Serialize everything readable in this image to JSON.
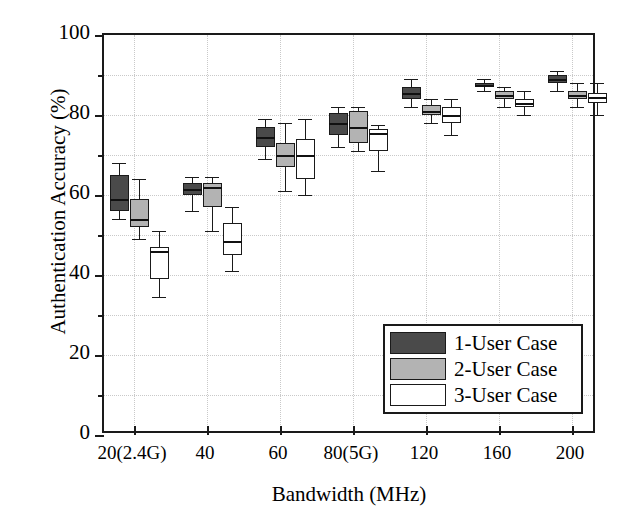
{
  "chart_data": {
    "type": "box",
    "title": "",
    "xlabel": "Bandwidth (MHz)",
    "ylabel": "Authentication Accuracy (%)",
    "ylim": [
      0,
      100
    ],
    "ytick_labels": [
      "0",
      "20",
      "40",
      "60",
      "80",
      "100"
    ],
    "ytick_values": [
      0,
      20,
      40,
      60,
      80,
      100
    ],
    "yminor_values": [
      10,
      30,
      50,
      70,
      90
    ],
    "grid": true,
    "legend_position": "lower right",
    "categories": [
      "20(2.4G)",
      "40",
      "60",
      "80(5G)",
      "120",
      "160",
      "200"
    ],
    "series": [
      {
        "name": "1-User Case",
        "color": "#4a4a4a",
        "boxes": [
          {
            "category": "20(2.4G)",
            "whisker_low": 54.0,
            "q1": 56.0,
            "median": 59.0,
            "q3": 65.0,
            "whisker_high": 68.0
          },
          {
            "category": "40",
            "whisker_low": 56.0,
            "q1": 60.0,
            "median": 61.5,
            "q3": 63.0,
            "whisker_high": 64.5
          },
          {
            "category": "60",
            "whisker_low": 69.0,
            "q1": 72.0,
            "median": 74.5,
            "q3": 77.0,
            "whisker_high": 79.0
          },
          {
            "category": "80(5G)",
            "whisker_low": 72.0,
            "q1": 75.0,
            "median": 78.0,
            "q3": 80.5,
            "whisker_high": 82.0
          },
          {
            "category": "120",
            "whisker_low": 82.0,
            "q1": 84.0,
            "median": 85.5,
            "q3": 87.0,
            "whisker_high": 89.0
          },
          {
            "category": "160",
            "whisker_low": 86.0,
            "q1": 87.0,
            "median": 87.5,
            "q3": 88.0,
            "whisker_high": 89.0
          },
          {
            "category": "200",
            "whisker_low": 86.0,
            "q1": 88.0,
            "median": 89.0,
            "q3": 90.0,
            "whisker_high": 91.0
          }
        ]
      },
      {
        "name": "2-User Case",
        "color": "#b3b3b3",
        "boxes": [
          {
            "category": "20(2.4G)",
            "whisker_low": 49.0,
            "q1": 52.0,
            "median": 54.0,
            "q3": 59.0,
            "whisker_high": 64.0
          },
          {
            "category": "40",
            "whisker_low": 51.0,
            "q1": 57.0,
            "median": 62.0,
            "q3": 63.0,
            "whisker_high": 64.5
          },
          {
            "category": "60",
            "whisker_low": 61.0,
            "q1": 67.0,
            "median": 70.0,
            "q3": 73.0,
            "whisker_high": 78.0
          },
          {
            "category": "80(5G)",
            "whisker_low": 71.0,
            "q1": 73.0,
            "median": 77.0,
            "q3": 81.0,
            "whisker_high": 82.0
          },
          {
            "category": "120",
            "whisker_low": 78.0,
            "q1": 80.0,
            "median": 81.0,
            "q3": 82.5,
            "whisker_high": 84.0
          },
          {
            "category": "160",
            "whisker_low": 82.0,
            "q1": 84.0,
            "median": 85.0,
            "q3": 86.0,
            "whisker_high": 87.0
          },
          {
            "category": "200",
            "whisker_low": 82.0,
            "q1": 84.0,
            "median": 85.0,
            "q3": 86.0,
            "whisker_high": 88.0
          }
        ]
      },
      {
        "name": "3-User Case",
        "color": "#ffffff",
        "boxes": [
          {
            "category": "20(2.4G)",
            "whisker_low": 34.5,
            "q1": 39.0,
            "median": 46.0,
            "q3": 47.0,
            "whisker_high": 51.0
          },
          {
            "category": "40",
            "whisker_low": 41.0,
            "q1": 45.0,
            "median": 48.5,
            "q3": 53.0,
            "whisker_high": 57.0
          },
          {
            "category": "60",
            "whisker_low": 60.0,
            "q1": 64.0,
            "median": 70.0,
            "q3": 74.0,
            "whisker_high": 79.0
          },
          {
            "category": "80(5G)",
            "whisker_low": 66.0,
            "q1": 71.0,
            "median": 75.5,
            "q3": 76.5,
            "whisker_high": 77.5
          },
          {
            "category": "120",
            "whisker_low": 75.0,
            "q1": 78.0,
            "median": 80.0,
            "q3": 82.0,
            "whisker_high": 84.0
          },
          {
            "category": "160",
            "whisker_low": 80.0,
            "q1": 82.0,
            "median": 83.0,
            "q3": 84.0,
            "whisker_high": 86.0
          },
          {
            "category": "200",
            "whisker_low": 80.0,
            "q1": 83.0,
            "median": 84.5,
            "q3": 85.5,
            "whisker_high": 88.0
          }
        ]
      }
    ]
  },
  "axes": {
    "ylabel": "Authentication Accuracy (%)",
    "xlabel": "Bandwidth (MHz)"
  },
  "legend": {
    "items": [
      {
        "label": "1-User Case",
        "color": "#4a4a4a"
      },
      {
        "label": "2-User Case",
        "color": "#b3b3b3"
      },
      {
        "label": "3-User Case",
        "color": "#ffffff"
      }
    ]
  }
}
